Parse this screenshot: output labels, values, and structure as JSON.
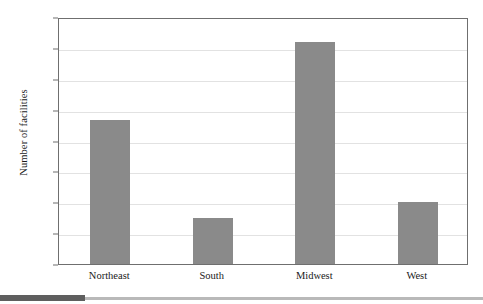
{
  "chart_data": {
    "type": "bar",
    "title": "",
    "xlabel": "",
    "ylabel": "Number of facilities",
    "categories": [
      "Northeast",
      "South",
      "Midwest",
      "West"
    ],
    "values": [
      930,
      300,
      1440,
      400
    ],
    "ylim": [
      0,
      1600
    ],
    "ytick_values": [
      0,
      200,
      400,
      600,
      800,
      1000,
      1200,
      1400,
      1600
    ],
    "ytick_labels": [
      "0",
      "200",
      "400",
      "600",
      "800",
      "1,000",
      "1,200",
      "1,400",
      "1,600"
    ],
    "grid": true,
    "legend": false,
    "bar_color": "#8a8a8a",
    "gridline_color": "#e2e2e2",
    "frame_color": "#6f6f6f"
  }
}
